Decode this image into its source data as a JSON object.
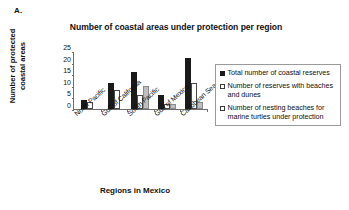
{
  "panel": {
    "label": "A."
  },
  "axis_titles": {
    "y_line1": "Number of protected",
    "y_line2": "coastal areas",
    "x": "Regions in Mexico"
  },
  "legend": {
    "items": [
      {
        "marker": "filled-square-black",
        "label": "Total number of coastal reserves"
      },
      {
        "marker": "open-square",
        "label": "Number of reserves with beaches and dunes"
      },
      {
        "marker": "open-square",
        "label": "Number of nesting beaches for marine turtles under protection"
      }
    ]
  },
  "chart_data": {
    "type": "bar",
    "title": "Number of coastal areas under protection per region",
    "xlabel": "Regions in Mexico",
    "ylabel": "Number of protected coastal areas",
    "ylim": [
      0,
      25
    ],
    "yticks": [
      0,
      5,
      10,
      15,
      20,
      25
    ],
    "grid": false,
    "legend_position": "right",
    "categories": [
      "North Pacific",
      "Gulf of California",
      "South Pacific",
      "Gulf of Mexico",
      "Caribbean Sea"
    ],
    "series": [
      {
        "name": "Total number of coastal reserves",
        "color": "#1a1a1a",
        "values": [
          4,
          11,
          16,
          6,
          22
        ]
      },
      {
        "name": "Number of reserves with beaches and dunes",
        "color": "#ffffff",
        "values": [
          3,
          8,
          6,
          2,
          11
        ]
      },
      {
        "name": "Number of nesting beaches for marine turtles under protection",
        "color": "#bfbfbf",
        "values": [
          0,
          0,
          10,
          2,
          3
        ]
      }
    ]
  }
}
